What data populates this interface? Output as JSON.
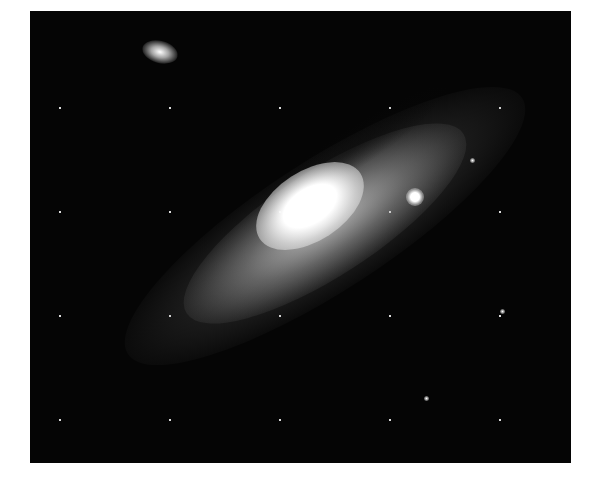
{
  "image": {
    "subject": "Andromeda Galaxy (M31)",
    "description": "Grayscale astronomical photograph of a spiral galaxy seen at an oblique angle against a dense star field, with a bright companion galaxy to the lower right of the core and a fainter elliptical companion at the upper left.",
    "border_color": "#ffffff",
    "background_color": "#050505"
  }
}
